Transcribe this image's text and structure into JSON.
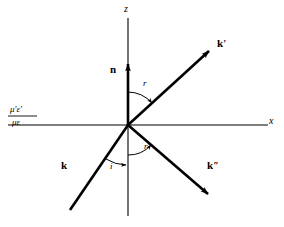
{
  "figure": {
    "width": 284,
    "height": 227,
    "background_color": "#ffffff",
    "line_color": "#000000"
  },
  "axes": {
    "z_label": "z",
    "x_label": "x",
    "origin": {
      "x": 128,
      "y": 125
    },
    "z_axis": {
      "x1": 128,
      "y1": 18,
      "x2": 128,
      "y2": 216
    },
    "x_axis": {
      "x1": 8,
      "y1": 125,
      "x2": 268,
      "y2": 125
    }
  },
  "media": {
    "upper_label": "μ'ε'",
    "lower_label": "με"
  },
  "vectors": [
    {
      "name": "normal",
      "label": "n",
      "prime": "",
      "description": "unit normal to interface, along +z",
      "x1": 128,
      "y1": 125,
      "x2": 128,
      "y2": 62,
      "has_arrow": true,
      "stroke_width": 2.6
    },
    {
      "name": "incident-wave-vector",
      "label": "k",
      "prime": "",
      "description": "incident wave vector travelling up-right toward origin",
      "x1": 70,
      "y1": 210,
      "x2": 128,
      "y2": 125,
      "has_arrow": false,
      "stroke_width": 2.6
    },
    {
      "name": "reflected-wave-vector",
      "label": "k",
      "prime": "′",
      "description": "reflected wave vector leaving origin to upper right",
      "x1": 128,
      "y1": 125,
      "x2": 212,
      "y2": 48,
      "has_arrow": true,
      "stroke_width": 2.6
    },
    {
      "name": "refracted-wave-vector",
      "label": "k",
      "prime": "″",
      "description": "refracted (transmitted) wave vector leaving origin to lower right",
      "x1": 128,
      "y1": 125,
      "x2": 211,
      "y2": 197,
      "has_arrow": true,
      "stroke_width": 2.6
    }
  ],
  "angles": [
    {
      "name": "angle-of-reflection",
      "label": "r",
      "description": "angle between normal n and reflected ray k'",
      "value_deg": 42,
      "arc_radius": 33,
      "label_x": 144,
      "label_y": 84
    },
    {
      "name": "angle-of-refraction",
      "label": "r′",
      "description": "angle between downward normal and refracted ray k''",
      "value_deg": 41,
      "arc_radius": 30,
      "label_x": 145,
      "label_y": 146
    },
    {
      "name": "angle-of-incidence",
      "label": "i",
      "description": "angle between incident ray k and downward normal",
      "value_deg": 34,
      "arc_radius": 40,
      "label_x": 109,
      "label_y": 166
    }
  ],
  "labels": {
    "z": {
      "text": "z",
      "x": 124,
      "y": 6
    },
    "x": {
      "text": "x",
      "x": 268,
      "y": 119
    },
    "n": {
      "text": "n",
      "x": 111,
      "y": 67
    },
    "k": {
      "text": "k",
      "x": 62,
      "y": 163
    },
    "k_prime": {
      "text": "k",
      "x": 218,
      "y": 40
    },
    "k_double_prime": {
      "text": "k",
      "x": 208,
      "y": 163
    },
    "media_upper": {
      "text": "μ'ε'",
      "x": 8,
      "y": 106
    },
    "media_lower": {
      "text": "με",
      "x": 8,
      "y": 117
    }
  }
}
